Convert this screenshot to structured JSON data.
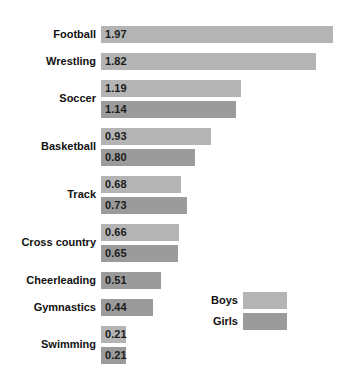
{
  "chart_data": {
    "type": "bar",
    "orientation": "horizontal",
    "title": "",
    "subtitle": "",
    "xlabel": "",
    "ylabel": "",
    "grid": false,
    "axis_visible": false,
    "tick_labels": [],
    "xlim": [
      0,
      2.1
    ],
    "value_label_format": "0.00",
    "legend": {
      "position": "bottom-right",
      "entries": [
        {
          "name": "Boys",
          "color": "#b4b4b4"
        },
        {
          "name": "Girls",
          "color": "#9b9b9b"
        }
      ]
    },
    "categories": [
      "Football",
      "Wrestling",
      "Soccer",
      "Basketball",
      "Track",
      "Cross country",
      "Cheerleading",
      "Gymnastics",
      "Swimming"
    ],
    "series": [
      {
        "name": "Boys",
        "color": "#b4b4b4",
        "values": [
          1.97,
          1.82,
          1.19,
          0.93,
          0.68,
          0.66,
          null,
          null,
          0.21
        ]
      },
      {
        "name": "Girls",
        "color": "#9b9b9b",
        "values": [
          null,
          null,
          1.14,
          0.8,
          0.73,
          0.65,
          0.51,
          0.44,
          0.21
        ]
      }
    ],
    "groups": [
      {
        "category": "Football",
        "bars": [
          {
            "series": "Boys",
            "value": 1.97,
            "label": "1.97"
          }
        ]
      },
      {
        "category": "Wrestling",
        "bars": [
          {
            "series": "Boys",
            "value": 1.82,
            "label": "1.82"
          }
        ]
      },
      {
        "category": "Soccer",
        "bars": [
          {
            "series": "Boys",
            "value": 1.19,
            "label": "1.19"
          },
          {
            "series": "Girls",
            "value": 1.14,
            "label": "1.14"
          }
        ]
      },
      {
        "category": "Basketball",
        "bars": [
          {
            "series": "Boys",
            "value": 0.93,
            "label": "0.93"
          },
          {
            "series": "Girls",
            "value": 0.8,
            "label": "0.80"
          }
        ]
      },
      {
        "category": "Track",
        "bars": [
          {
            "series": "Boys",
            "value": 0.68,
            "label": "0.68"
          },
          {
            "series": "Girls",
            "value": 0.73,
            "label": "0.73"
          }
        ]
      },
      {
        "category": "Cross country",
        "bars": [
          {
            "series": "Boys",
            "value": 0.66,
            "label": "0.66"
          },
          {
            "series": "Girls",
            "value": 0.65,
            "label": "0.65"
          }
        ]
      },
      {
        "category": "Cheerleading",
        "bars": [
          {
            "series": "Girls",
            "value": 0.51,
            "label": "0.51"
          }
        ]
      },
      {
        "category": "Gymnastics",
        "bars": [
          {
            "series": "Girls",
            "value": 0.44,
            "label": "0.44"
          }
        ]
      },
      {
        "category": "Swimming",
        "bars": [
          {
            "series": "Boys",
            "value": 0.21,
            "label": "0.21"
          },
          {
            "series": "Girls",
            "value": 0.21,
            "label": "0.21"
          }
        ]
      }
    ]
  }
}
